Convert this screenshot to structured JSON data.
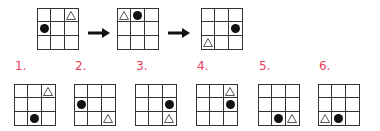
{
  "sequence": [
    {
      "dot": [
        1,
        0
      ],
      "tri": [
        0,
        2
      ]
    },
    {
      "dot": [
        0,
        1
      ],
      "tri": [
        0,
        0
      ]
    },
    {
      "dot": [
        1,
        2
      ],
      "tri": [
        2,
        0
      ]
    }
  ],
  "options": [
    {
      "label": "1.",
      "dot": [
        2,
        1
      ],
      "tri": [
        0,
        2
      ]
    },
    {
      "label": "2.",
      "dot": [
        1,
        0
      ],
      "tri": [
        2,
        2
      ]
    },
    {
      "label": "3.",
      "dot": [
        1,
        2
      ],
      "tri": [
        2,
        2
      ]
    },
    {
      "label": "4.",
      "dot": [
        1,
        2
      ],
      "tri": [
        0,
        2
      ]
    },
    {
      "label": "5.",
      "dot": [
        2,
        1
      ],
      "tri": [
        2,
        2
      ]
    },
    {
      "label": "6.",
      "dot": [
        2,
        1
      ],
      "tri": [
        2,
        0
      ]
    }
  ],
  "colors": {
    "label": "#e8405a",
    "line": "#333333",
    "dot": "#111111"
  }
}
